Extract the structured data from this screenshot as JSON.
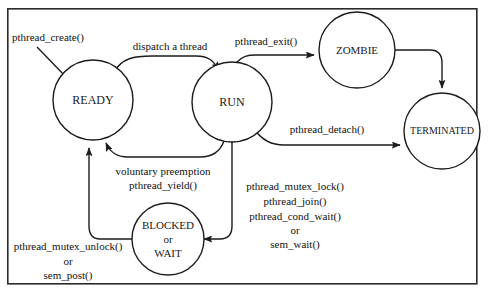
{
  "diagram": {
    "frame": {
      "x": 7,
      "y": 8,
      "width": 471,
      "height": 277
    },
    "colors": {
      "background": "#ffffff",
      "stroke": "#1c1c1c",
      "text": "#111111",
      "frame": "#2a2a2a"
    },
    "states": [
      {
        "id": "ready",
        "label": "READY",
        "cx": 93,
        "cy": 100,
        "r": 40,
        "font_size": 12,
        "lines": [
          "READY"
        ]
      },
      {
        "id": "run",
        "label": "RUN",
        "cx": 232,
        "cy": 102,
        "r": 40,
        "font_size": 12,
        "lines": [
          "RUN"
        ]
      },
      {
        "id": "zombie",
        "label": "ZOMBIE",
        "cx": 357,
        "cy": 50,
        "r": 38,
        "font_size": 11,
        "lines": [
          "ZOMBIE"
        ]
      },
      {
        "id": "terminated",
        "label": "TERMINATED",
        "cx": 442,
        "cy": 131,
        "r": 38,
        "font_size": 10,
        "lines": [
          "TERMINATED"
        ]
      },
      {
        "id": "blocked",
        "label": "BLOCKED or WAIT",
        "cx": 168,
        "cy": 239,
        "r": 36,
        "font_size": 11,
        "lines": [
          "BLOCKED",
          "or",
          "WAIT"
        ]
      }
    ],
    "edges": [
      {
        "id": "create-to-ready",
        "from": "start",
        "to": "ready",
        "label": "pthread_create()"
      },
      {
        "id": "ready-to-run",
        "from": "ready",
        "to": "run",
        "label": "dispatch a thread"
      },
      {
        "id": "run-to-zombie",
        "from": "run",
        "to": "zombie",
        "label": "pthread_exit()"
      },
      {
        "id": "zombie-to-terminated",
        "from": "zombie",
        "to": "terminated",
        "label": ""
      },
      {
        "id": "run-to-terminated",
        "from": "run",
        "to": "terminated",
        "label": "pthread_detach()"
      },
      {
        "id": "run-to-ready",
        "from": "run",
        "to": "ready",
        "label": "voluntary preemption pthread_yield()"
      },
      {
        "id": "run-to-blocked",
        "from": "run",
        "to": "blocked",
        "label": "pthread_mutex_lock() pthread_join() pthread_cond_wait() or sem_wait()"
      },
      {
        "id": "blocked-to-ready",
        "from": "blocked",
        "to": "ready",
        "label": "pthread_mutex_unlock() or sem_post()"
      }
    ],
    "labels": {
      "pthread_create": {
        "text": "pthread_create()",
        "x": 48,
        "y": 38,
        "font_size": 11
      },
      "dispatch_a_thread": {
        "text": "dispatch a thread",
        "x": 170,
        "y": 47,
        "font_size": 11
      },
      "pthread_exit": {
        "text": "pthread_exit()",
        "x": 266,
        "y": 42,
        "font_size": 11
      },
      "pthread_detach": {
        "text": "pthread_detach()",
        "x": 327,
        "y": 130,
        "font_size": 11
      },
      "voluntary_preemption": {
        "line1": "voluntary preemption",
        "line2": "pthread_yield()",
        "x": 163,
        "y1": 172,
        "y2": 186,
        "font_size": 11
      },
      "block_calls": {
        "line1": "pthread_mutex_lock()",
        "line2": "pthread_join()",
        "line3": "pthread_cond_wait()",
        "line4": "or",
        "line5": "sem_wait()",
        "x": 295,
        "y1": 187,
        "y2": 202,
        "y3": 217,
        "y4": 231,
        "y5": 245,
        "font_size": 11
      },
      "unblock_calls": {
        "line1": "pthread_mutex_unlock()",
        "line2": "or",
        "line3": "sem_post()",
        "x": 68,
        "y1": 247,
        "y2": 262,
        "y3": 276,
        "font_size": 11
      }
    }
  }
}
